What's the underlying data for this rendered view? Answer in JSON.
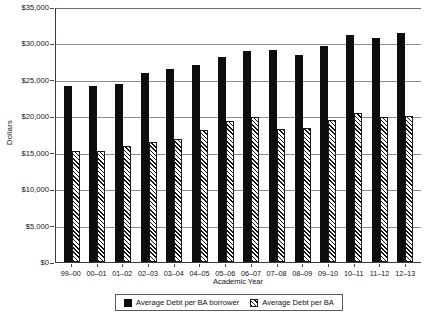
{
  "chart_data": {
    "type": "bar",
    "title": "",
    "xlabel": "Academic Year",
    "ylabel": "Dollars",
    "ylim": [
      0,
      35000
    ],
    "ytick_step": 5000,
    "grid": true,
    "legend_position": "bottom",
    "categories": [
      "99–00",
      "00–01",
      "01–02",
      "02–03",
      "03–04",
      "04–05",
      "05–06",
      "06–07",
      "07–08",
      "08–09",
      "09–10",
      "10–11",
      "11–12",
      "12–13"
    ],
    "ytick_labels": [
      "$35,000",
      "$30,000",
      "$25,000",
      "$20,000",
      "$15,000",
      "$10,000",
      "$5,000",
      "$0"
    ],
    "ytick_values": [
      35000,
      30000,
      25000,
      20000,
      15000,
      10000,
      5000,
      0
    ],
    "series": [
      {
        "name": "Average Debt per BA borrower",
        "pattern": "solid",
        "color": "#0d0d0d",
        "values": [
          24200,
          24200,
          24400,
          25900,
          26500,
          27100,
          28200,
          29000,
          29100,
          28400,
          29700,
          31100,
          30800,
          31400
        ]
      },
      {
        "name": "Average Debt per BA",
        "pattern": "hatched",
        "color": "#ffffff",
        "values": [
          15200,
          15200,
          15900,
          16500,
          16900,
          18100,
          19300,
          19900,
          18300,
          18400,
          19500,
          20400,
          19900,
          20000
        ]
      }
    ]
  },
  "legend": {
    "items": [
      {
        "label": "Average Debt per BA borrower",
        "pattern": "solid"
      },
      {
        "label": "Average Debt per BA",
        "pattern": "hatched"
      }
    ]
  }
}
